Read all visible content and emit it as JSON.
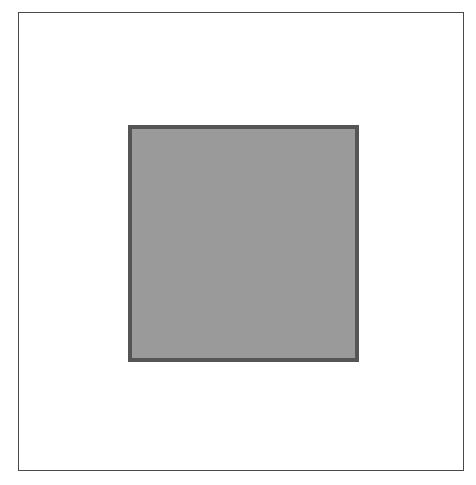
{
  "diagram": {
    "frame": {
      "label": "outer-frame",
      "stroke_color": "#4a4a4a",
      "fill_color": "#ffffff"
    },
    "shape": {
      "type": "square",
      "stroke_color": "#555555",
      "fill_color": "#9a9a9a"
    }
  }
}
